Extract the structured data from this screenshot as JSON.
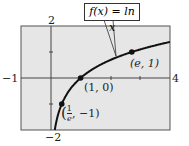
{
  "chart_data": {
    "type": "line",
    "title": "",
    "function_label": "f(x) = ln x",
    "xlabel": "",
    "ylabel": "",
    "xlim": [
      -1,
      4
    ],
    "ylim": [
      -2,
      2
    ],
    "x_tick_labels": [
      "-1",
      "4"
    ],
    "y_tick_labels": [
      "2",
      "-2"
    ],
    "grid": false,
    "series": [
      {
        "name": "f(x) = ln x",
        "x": [
          0.135,
          0.25,
          0.368,
          0.5,
          0.75,
          1,
          1.5,
          2,
          2.718,
          3,
          3.5,
          4
        ],
        "y": [
          -2,
          -1.386,
          -1,
          -0.693,
          -0.288,
          0,
          0.405,
          0.693,
          1,
          1.099,
          1.253,
          1.386
        ]
      }
    ],
    "points": [
      {
        "x": 0.368,
        "y": -1,
        "label": "(1/e, -1)"
      },
      {
        "x": 1,
        "y": 0,
        "label": "(1, 0)"
      },
      {
        "x": 2.718,
        "y": 1,
        "label": "(e, 1)"
      }
    ]
  },
  "labels": {
    "func": "f(x) = ln x",
    "xmin": "−1",
    "xmax": "4",
    "ymax": "2",
    "ymin": "−2",
    "p1": "(1, 0)",
    "p2": "(e, 1)",
    "p3_num": "1",
    "p3_den": "e",
    "p3_rest": ", −1)"
  }
}
